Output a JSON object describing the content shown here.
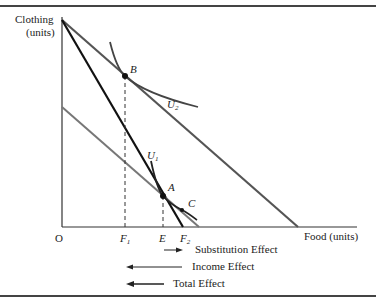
{
  "diagram": {
    "type": "income_substitution_effects",
    "axes": {
      "y_label_line1": "Clothing",
      "y_label_line2": "(units)",
      "x_label": "Food (units)",
      "origin": "O"
    },
    "points": {
      "A": "A",
      "B": "B",
      "C": "C"
    },
    "curves": {
      "U1": "U",
      "U1_sub": "1",
      "U2": "U",
      "U2_sub": "2"
    },
    "x_ticks": {
      "F1": "F",
      "F1_sub": "1",
      "E": "E",
      "F2": "F",
      "F2_sub": "2"
    },
    "effects": {
      "substitution": "Substitution Effect",
      "income": "Income Effect",
      "total": "Total Effect"
    },
    "colors": {
      "black_line": "#111111",
      "gray_line": "#555555",
      "light_gray_line": "#777777"
    }
  }
}
